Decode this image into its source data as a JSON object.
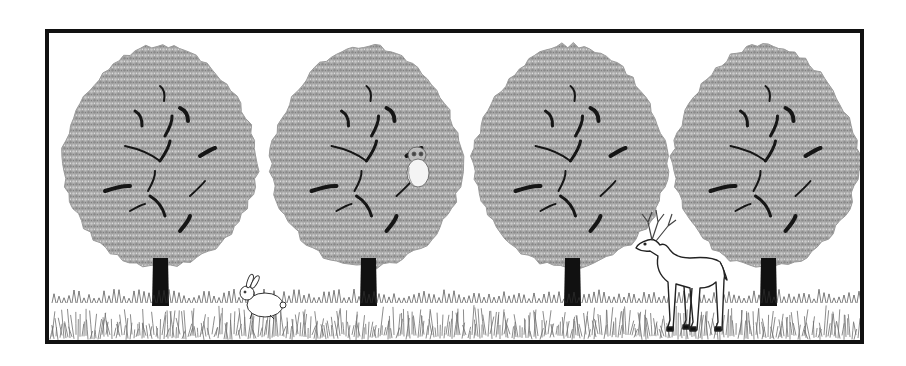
{
  "scene": {
    "description": "Line-art illustration of four trees in a row on a grassy field inside a black frame, with a rabbit, an owl, and a deer",
    "frame": {
      "x": 47,
      "y": 31,
      "width": 815,
      "height": 311,
      "stroke": "#111111",
      "stroke_width": 4
    },
    "colors": {
      "background": "#ffffff",
      "foliage": "#a9a9a9",
      "foliage_dark": "#8a8a8a",
      "branches": "#1a1a1a",
      "trunk": "#111111",
      "grass": "#777777",
      "animal_fill": "#ffffff",
      "animal_stroke": "#333333"
    },
    "trees": [
      {
        "id": "tree-1",
        "cx": 160,
        "crown": {
          "x": 62,
          "y": 45,
          "w": 196,
          "h": 222
        },
        "trunk": {
          "x": 153,
          "y": 258,
          "w": 15,
          "h": 48
        }
      },
      {
        "id": "tree-2",
        "cx": 368,
        "crown": {
          "x": 270,
          "y": 45,
          "w": 193,
          "h": 222
        },
        "trunk": {
          "x": 361,
          "y": 258,
          "w": 15,
          "h": 48
        },
        "has_owl": true
      },
      {
        "id": "tree-3",
        "cx": 572,
        "crown": {
          "x": 473,
          "y": 45,
          "w": 195,
          "h": 222
        },
        "trunk": {
          "x": 565,
          "y": 258,
          "w": 15,
          "h": 48
        }
      },
      {
        "id": "tree-4",
        "cx": 768,
        "crown": {
          "x": 672,
          "y": 45,
          "w": 187,
          "h": 222
        },
        "trunk": {
          "x": 761,
          "y": 258,
          "w": 15,
          "h": 48
        }
      }
    ],
    "animals": [
      {
        "type": "rabbit",
        "x": 240,
        "y": 283,
        "location": "grass between tree 1 and tree 2"
      },
      {
        "type": "owl",
        "x": 405,
        "y": 145,
        "location": "perched in tree 2"
      },
      {
        "type": "deer",
        "x": 632,
        "y": 210,
        "location": "standing in grass between tree 3 and tree 4"
      }
    ],
    "ground": {
      "type": "grass",
      "y_top": 295,
      "y_bottom": 340
    }
  }
}
